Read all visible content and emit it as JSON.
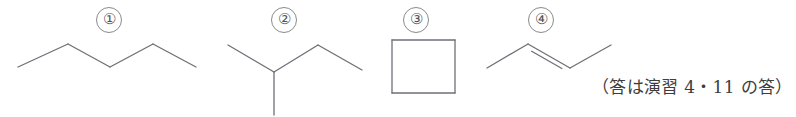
{
  "page": {
    "background_color": "#ffffff",
    "line_color": "#6f6f77",
    "text_color": "#3d3d3d",
    "width": 796,
    "height": 117
  },
  "items": [
    {
      "label": "①",
      "name": "pentane",
      "type": "skeletal-formula",
      "description": "unbranched four-bond zigzag chain (pentane)"
    },
    {
      "label": "②",
      "name": "2-methylbutane",
      "type": "skeletal-formula",
      "description": "branched chain with one vertical methyl branch (2-methylbutane)"
    },
    {
      "label": "③",
      "name": "cyclobutane",
      "type": "skeletal-formula",
      "description": "square ring (cyclobutane)"
    },
    {
      "label": "④",
      "name": "2-butene",
      "type": "skeletal-formula",
      "description": "four-carbon chain with a central double bond (2-butene)"
    }
  ],
  "annotation": {
    "text": "（答は演習 4・11 の答）"
  },
  "chart_data": {
    "type": "diagram",
    "title": "",
    "structures": [
      {
        "id": 1,
        "label": "①",
        "name": "pentane",
        "vertices": [
          [
            18,
            67
          ],
          [
            68,
            44
          ],
          [
            110,
            67
          ],
          [
            153,
            44
          ],
          [
            196,
            67
          ]
        ],
        "bonds": [
          {
            "from": 0,
            "to": 1,
            "order": 1
          },
          {
            "from": 1,
            "to": 2,
            "order": 1
          },
          {
            "from": 2,
            "to": 3,
            "order": 1
          },
          {
            "from": 3,
            "to": 4,
            "order": 1
          }
        ]
      },
      {
        "id": 2,
        "label": "②",
        "name": "2-methylbutane",
        "vertices": [
          [
            228,
            45
          ],
          [
            274,
            72
          ],
          [
            318,
            45
          ],
          [
            362,
            70
          ],
          [
            274,
            115
          ]
        ],
        "bonds": [
          {
            "from": 0,
            "to": 1,
            "order": 1
          },
          {
            "from": 1,
            "to": 2,
            "order": 1
          },
          {
            "from": 2,
            "to": 3,
            "order": 1
          },
          {
            "from": 1,
            "to": 4,
            "order": 1
          }
        ]
      },
      {
        "id": 3,
        "label": "③",
        "name": "cyclobutane",
        "vertices": [
          [
            392,
            40
          ],
          [
            455,
            40
          ],
          [
            455,
            93
          ],
          [
            392,
            93
          ]
        ],
        "bonds": [
          {
            "from": 0,
            "to": 1,
            "order": 1
          },
          {
            "from": 1,
            "to": 2,
            "order": 1
          },
          {
            "from": 2,
            "to": 3,
            "order": 1
          },
          {
            "from": 3,
            "to": 0,
            "order": 1
          }
        ]
      },
      {
        "id": 4,
        "label": "④",
        "name": "2-butene",
        "vertices": [
          [
            487,
            68
          ],
          [
            528,
            44
          ],
          [
            570,
            68
          ],
          [
            611,
            45
          ]
        ],
        "bonds": [
          {
            "from": 0,
            "to": 1,
            "order": 1
          },
          {
            "from": 1,
            "to": 2,
            "order": 2
          },
          {
            "from": 2,
            "to": 3,
            "order": 1
          }
        ]
      }
    ]
  }
}
